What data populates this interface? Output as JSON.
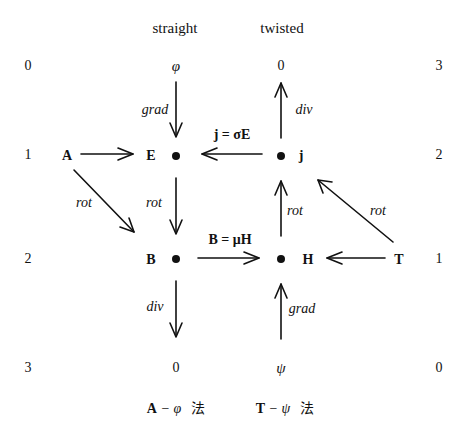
{
  "columns": {
    "straight": "straight",
    "twisted": "twisted"
  },
  "left_degrees": [
    "0",
    "1",
    "2",
    "3"
  ],
  "right_degrees": [
    "3",
    "2",
    "1",
    "0"
  ],
  "nodes": {
    "phi": "φ",
    "zero_top": "0",
    "A": "A",
    "E": "E",
    "j": "j",
    "B": "B",
    "H": "H",
    "T": "T",
    "zero_bottom": "0",
    "psi": "ψ"
  },
  "edges": {
    "grad_phi_E": "grad",
    "div_j_0": "div",
    "j_sigma_E": "j = σE",
    "rot_A_B": "rot",
    "rot_E_B": "rot",
    "rot_H_j": "rot",
    "rot_T_j": "rot",
    "B_mu_H": "B = μH",
    "div_B_0": "div",
    "grad_psi_H": "grad"
  },
  "methods": {
    "a_phi": {
      "bold": "A",
      "rest": " − φ",
      "han": "法"
    },
    "t_psi": {
      "bold": "T",
      "rest": " − ψ",
      "han": "法"
    }
  },
  "colors": {
    "ink": "#111111",
    "background": "#ffffff"
  }
}
